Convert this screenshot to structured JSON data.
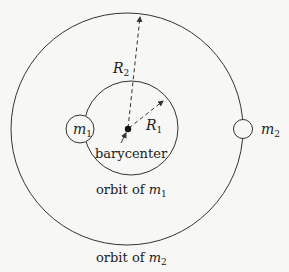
{
  "diagram": {
    "labels": {
      "m1_symbol": "m",
      "m1_sub": "1",
      "m2_symbol": "m",
      "m2_sub": "2",
      "r1_symbol": "R",
      "r1_sub": "1",
      "r2_symbol": "R",
      "r2_sub": "2",
      "barycenter": "barycenter",
      "orbit1_prefix": "orbit of ",
      "orbit1_symbol": "m",
      "orbit1_sub": "1",
      "orbit2_prefix": "orbit of ",
      "orbit2_symbol": "m",
      "orbit2_sub": "2"
    },
    "colors": {
      "background": "#f7f7f5",
      "stroke": "#333333",
      "text": "#222222"
    },
    "nodes": [
      {
        "id": "barycenter",
        "shape": "filled-dot"
      },
      {
        "id": "m1",
        "shape": "circle"
      },
      {
        "id": "m2",
        "shape": "circle"
      },
      {
        "id": "orbit1",
        "shape": "circle",
        "label": "orbit of m1"
      },
      {
        "id": "orbit2",
        "shape": "circle",
        "label": "orbit of m2"
      }
    ],
    "edges": [
      {
        "from": "barycenter",
        "to": "orbit2",
        "style": "dashed-arrow",
        "label": "R2"
      },
      {
        "from": "barycenter",
        "to": "orbit1",
        "style": "dashed-arrow",
        "label": "R1"
      },
      {
        "from": "barycenter-label",
        "to": "barycenter",
        "style": "solid-arrow"
      }
    ]
  }
}
